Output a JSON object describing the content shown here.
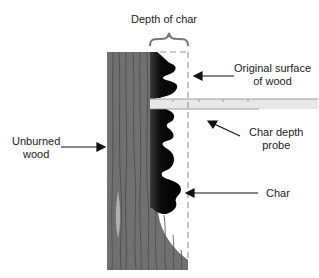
{
  "diagram": {
    "labels": {
      "depth_of_char": "Depth of char",
      "original_surface_line1": "Original surface",
      "original_surface_line2": "of wood",
      "char_depth_probe_line1": "Char depth",
      "char_depth_probe_line2": "probe",
      "unburned_line1": "Unburned",
      "unburned_line2": "wood",
      "char": "Char"
    },
    "colors": {
      "wood": "#707070",
      "grain": "#4a4a4a",
      "char": "#0a0a0a",
      "probe": "#e6e6e6",
      "bracket": "#777777",
      "dashed_line": "#9a9a9a",
      "arrow": "#111111"
    }
  }
}
